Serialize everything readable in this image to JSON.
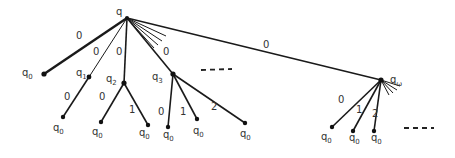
{
  "diagram": {
    "root": {
      "label": "q",
      "x": 127,
      "y": 18
    },
    "children": [
      {
        "name": "q",
        "sub": "0",
        "x": 44,
        "y": 74,
        "edge_label": "0",
        "edge_label_pos": [
          78,
          38
        ],
        "thick": true,
        "children": []
      },
      {
        "name": "q",
        "sub": "1",
        "x": 89,
        "y": 77,
        "edge_label": "0",
        "edge_label_pos": [
          96,
          53
        ],
        "children": [
          {
            "name": "q",
            "sub": "0",
            "x": 63,
            "y": 117,
            "edge_label": "0",
            "edge_label_pos": [
              67,
              99
            ]
          }
        ]
      },
      {
        "name": "q",
        "sub": "2",
        "x": 124,
        "y": 83,
        "edge_label": "0",
        "edge_label_pos": [
          119,
          53
        ],
        "children": [
          {
            "name": "q",
            "sub": "0",
            "x": 101,
            "y": 122,
            "edge_label": "0",
            "edge_label_pos": [
              101,
              99
            ]
          },
          {
            "name": "q",
            "sub": "0",
            "x": 148,
            "y": 125,
            "edge_label": "1",
            "edge_label_pos": [
              131,
              112
            ]
          }
        ]
      },
      {
        "name": "q",
        "sub": "3",
        "x": 173,
        "y": 74,
        "edge_label": "0",
        "edge_label_pos": [
          166,
          53
        ],
        "children": [
          {
            "name": "q",
            "sub": "0",
            "x": 168,
            "y": 127,
            "edge_label": "0",
            "edge_label_pos": [
              160,
              112
            ]
          },
          {
            "name": "q",
            "sub": "0",
            "x": 197,
            "y": 119,
            "edge_label": "1",
            "edge_label_pos": [
              183,
              112
            ]
          },
          {
            "name": "q",
            "sub": "0",
            "x": 245,
            "y": 123,
            "edge_label": "2",
            "edge_label_pos": [
              213,
              106
            ]
          }
        ]
      },
      {
        "name": "q",
        "sub": "ω",
        "x": 381,
        "y": 80,
        "edge_label": "0",
        "edge_label_pos": [
          266,
          48
        ],
        "children": [
          {
            "name": "q",
            "sub": "0",
            "x": 332,
            "y": 127,
            "edge_label": "0",
            "edge_label_pos": [
              341,
              103
            ]
          },
          {
            "name": "q",
            "sub": "0",
            "x": 353,
            "y": 131,
            "edge_label": "1",
            "edge_label_pos": [
              358,
              113
            ]
          },
          {
            "name": "q",
            "sub": "0",
            "x": 374,
            "y": 131,
            "edge_label": "2",
            "edge_label_pos": [
              374,
              117
            ]
          }
        ]
      }
    ],
    "ellipsis": [
      "- - -",
      "- - -"
    ]
  }
}
